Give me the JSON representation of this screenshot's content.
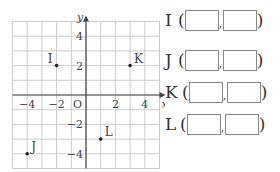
{
  "plot": {
    "axis_x_label": "x",
    "axis_y_label": "y",
    "origin_label": "O",
    "x_ticks": [
      {
        "v": -4,
        "t": "−4"
      },
      {
        "v": -2,
        "t": "−2"
      },
      {
        "v": 2,
        "t": "2"
      },
      {
        "v": 4,
        "t": "4"
      }
    ],
    "y_ticks": [
      {
        "v": 4,
        "t": "4"
      },
      {
        "v": 2,
        "t": "2"
      },
      {
        "v": -2,
        "t": "−2"
      },
      {
        "v": -4,
        "t": "−4"
      }
    ],
    "points": [
      {
        "name": "I",
        "x": -2,
        "y": 2
      },
      {
        "name": "J",
        "x": -4,
        "y": -4
      },
      {
        "name": "K",
        "x": 3,
        "y": 2
      },
      {
        "name": "L",
        "x": 1,
        "y": -3
      }
    ],
    "range": {
      "xmin": -5,
      "xmax": 5,
      "ymin": -5,
      "ymax": 5
    }
  },
  "answers": [
    {
      "name": "I",
      "open": "(",
      "close": ")",
      "sep": ",",
      "x": "",
      "y": ""
    },
    {
      "name": "J",
      "open": "(",
      "close": ")",
      "sep": ",",
      "x": "",
      "y": ""
    },
    {
      "name": "K",
      "open": "(",
      "close": ")",
      "sep": ",",
      "x": "",
      "y": ""
    },
    {
      "name": "L",
      "open": "(",
      "close": ")",
      "sep": ",",
      "x": "",
      "y": ""
    }
  ]
}
